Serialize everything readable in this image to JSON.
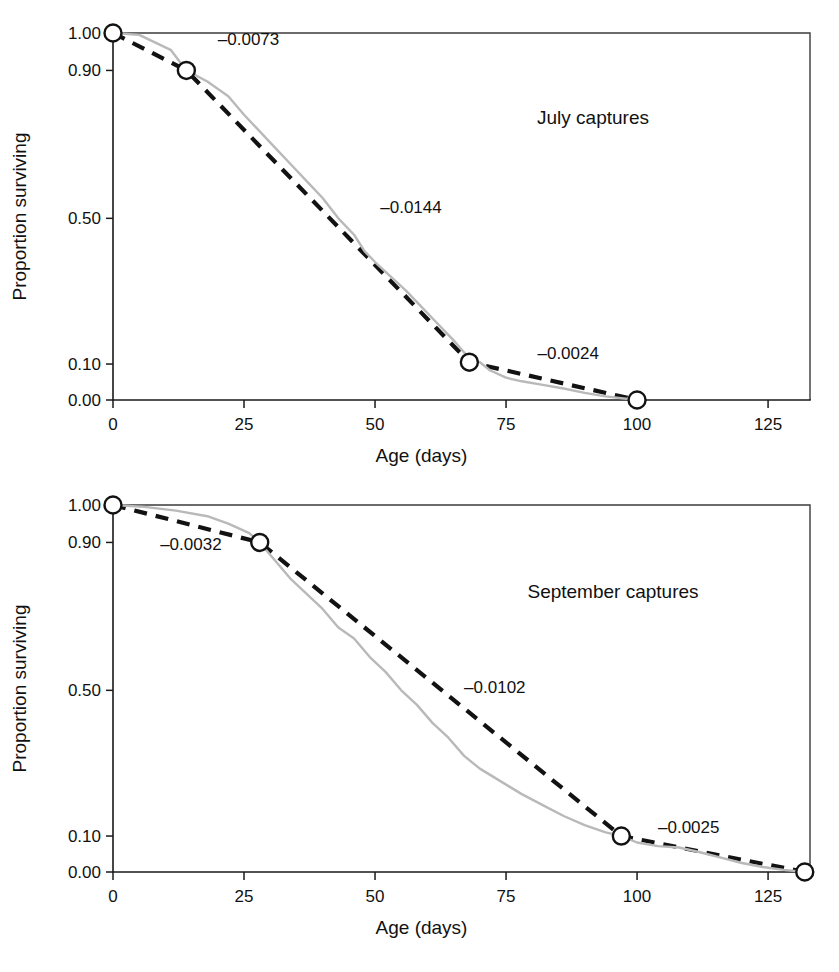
{
  "figure": {
    "background": "#ffffff",
    "marker_fill": "#ffffff",
    "marker_stroke": "#121212",
    "fit_color": "#121212",
    "empirical_color": "#b9b9b9",
    "axis_color": "#1a1a1a"
  },
  "chart_data": [
    {
      "type": "line",
      "id": "july",
      "title": "",
      "panel_label": "July captures",
      "xlabel": "Age (days)",
      "ylabel": "Proportion surviving",
      "xlim": [
        0,
        133
      ],
      "ylim": [
        0,
        1
      ],
      "xticks": [
        0,
        25,
        50,
        75,
        100,
        125
      ],
      "xticklabels": [
        "0",
        "25",
        "50",
        "75",
        "100",
        "125"
      ],
      "yticks": [
        1.0,
        0.9,
        0.5,
        0.1,
        0.0
      ],
      "yticklabels": [
        "1.00",
        "0.90",
        "0.50",
        "0.10",
        "0.00"
      ],
      "grid": false,
      "legend": "none",
      "series": [
        {
          "name": "Fitted piecewise survival",
          "style": "dashed",
          "color": "#121212",
          "x": [
            0,
            14,
            68,
            100
          ],
          "values": [
            1.0,
            0.9,
            0.105,
            0.0
          ]
        },
        {
          "name": "Observed survivorship",
          "style": "solid-thin",
          "color": "#b9b9b9",
          "x": [
            0,
            5,
            11,
            14,
            18,
            22,
            25,
            28,
            31,
            34,
            37,
            40,
            43,
            46,
            48,
            50,
            53,
            56,
            59,
            62,
            65,
            68,
            70,
            72,
            75,
            78,
            82,
            86,
            90,
            94,
            100
          ],
          "values": [
            1.0,
            0.995,
            0.955,
            0.9,
            0.87,
            0.83,
            0.78,
            0.735,
            0.69,
            0.645,
            0.6,
            0.555,
            0.5,
            0.455,
            0.41,
            0.38,
            0.34,
            0.3,
            0.255,
            0.21,
            0.165,
            0.115,
            0.105,
            0.082,
            0.062,
            0.052,
            0.042,
            0.032,
            0.02,
            0.01,
            0.0
          ]
        }
      ],
      "markers": [
        {
          "x": 0,
          "y": 1.0
        },
        {
          "x": 14,
          "y": 0.9
        },
        {
          "x": 68,
          "y": 0.105
        },
        {
          "x": 100,
          "y": 0.0
        }
      ],
      "annotations": [
        {
          "text": "–0.0073",
          "x": 20,
          "y": 0.985,
          "anchor": "start"
        },
        {
          "text": "–0.0144",
          "x": 51,
          "y": 0.53,
          "anchor": "start"
        },
        {
          "text": "–0.0024",
          "x": 81,
          "y": 0.13,
          "anchor": "start"
        }
      ]
    },
    {
      "type": "line",
      "id": "september",
      "title": "",
      "panel_label": "September captures",
      "xlabel": "Age (days)",
      "ylabel": "Proportion surviving",
      "xlim": [
        0,
        133
      ],
      "ylim": [
        0,
        1
      ],
      "xticks": [
        0,
        25,
        50,
        75,
        100,
        125
      ],
      "xticklabels": [
        "0",
        "25",
        "50",
        "75",
        "100",
        "125"
      ],
      "yticks": [
        1.0,
        0.9,
        0.5,
        0.1,
        0.0
      ],
      "yticklabels": [
        "1.00",
        "0.90",
        "0.50",
        "0.10",
        "0.00"
      ],
      "grid": false,
      "legend": "none",
      "series": [
        {
          "name": "Fitted piecewise survival",
          "style": "dashed",
          "color": "#121212",
          "x": [
            0,
            28,
            97,
            132
          ],
          "values": [
            1.0,
            0.9,
            0.1,
            0.0
          ]
        },
        {
          "name": "Observed survivorship",
          "style": "solid-thin",
          "color": "#b9b9b9",
          "x": [
            0,
            6,
            12,
            18,
            22,
            26,
            28,
            31,
            34,
            37,
            40,
            43,
            46,
            49,
            52,
            55,
            58,
            61,
            64,
            67,
            70,
            74,
            78,
            82,
            86,
            90,
            94,
            97,
            100,
            104,
            108,
            112,
            116,
            120,
            124,
            128,
            132
          ],
          "values": [
            1.0,
            0.995,
            0.985,
            0.97,
            0.95,
            0.925,
            0.9,
            0.85,
            0.8,
            0.76,
            0.72,
            0.67,
            0.64,
            0.59,
            0.55,
            0.5,
            0.46,
            0.41,
            0.37,
            0.32,
            0.285,
            0.25,
            0.215,
            0.185,
            0.155,
            0.13,
            0.11,
            0.1,
            0.082,
            0.072,
            0.068,
            0.055,
            0.04,
            0.025,
            0.014,
            0.006,
            0.0
          ]
        }
      ],
      "markers": [
        {
          "x": 0,
          "y": 1.0
        },
        {
          "x": 28,
          "y": 0.9
        },
        {
          "x": 97,
          "y": 0.1
        },
        {
          "x": 132,
          "y": 0.0
        }
      ],
      "annotations": [
        {
          "text": "–0.0032",
          "x": 9,
          "y": 0.895,
          "anchor": "start"
        },
        {
          "text": "–0.0102",
          "x": 67,
          "y": 0.51,
          "anchor": "start"
        },
        {
          "text": "–0.0025",
          "x": 104,
          "y": 0.125,
          "anchor": "start"
        }
      ]
    }
  ]
}
